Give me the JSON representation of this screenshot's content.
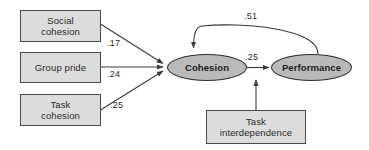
{
  "diagram": {
    "type": "path-model",
    "title": "",
    "nodes": [
      {
        "id": "social-cohesion",
        "shape": "rectangle",
        "label_line1": "Social",
        "label_line2": "cohesion"
      },
      {
        "id": "group-pride",
        "shape": "rectangle",
        "label_line1": "Group pride",
        "label_line2": ""
      },
      {
        "id": "task-cohesion",
        "shape": "rectangle",
        "label_line1": "Task",
        "label_line2": "cohesion"
      },
      {
        "id": "task-interdependence",
        "shape": "rectangle",
        "label_line1": "Task",
        "label_line2": "interdependence"
      },
      {
        "id": "cohesion",
        "shape": "ellipse",
        "label_line1": "Cohesion",
        "label_line2": ""
      },
      {
        "id": "performance",
        "shape": "ellipse",
        "label_line1": "Performance",
        "label_line2": ""
      }
    ],
    "edges": [
      {
        "id": "social-to-cohesion",
        "from": "social-cohesion",
        "to": "cohesion",
        "coefficient": ".17",
        "style": "straight-arrow"
      },
      {
        "id": "pride-to-cohesion",
        "from": "group-pride",
        "to": "cohesion",
        "coefficient": ".24",
        "style": "straight-arrow"
      },
      {
        "id": "taskcoh-to-cohesion",
        "from": "task-cohesion",
        "to": "cohesion",
        "coefficient": ".25",
        "style": "straight-arrow"
      },
      {
        "id": "cohesion-to-performance",
        "from": "cohesion",
        "to": "performance",
        "coefficient": ".25",
        "style": "straight-arrow"
      },
      {
        "id": "performance-to-cohesion",
        "from": "performance",
        "to": "cohesion",
        "coefficient": ".51",
        "style": "curved-arrow"
      },
      {
        "id": "interdependence-to-path",
        "from": "task-interdependence",
        "to": "cohesion-to-performance",
        "coefficient": "",
        "style": "straight-arrow"
      }
    ],
    "colors": {
      "box_fill": "#dcdcdc",
      "box_stroke": "#4a4a4a",
      "ellipse_fill": "#b9b9b9",
      "ellipse_stroke": "#2e2e2e",
      "line": "#3a3a3a",
      "text": "#2b2b2b",
      "background": "#ffffff"
    }
  }
}
